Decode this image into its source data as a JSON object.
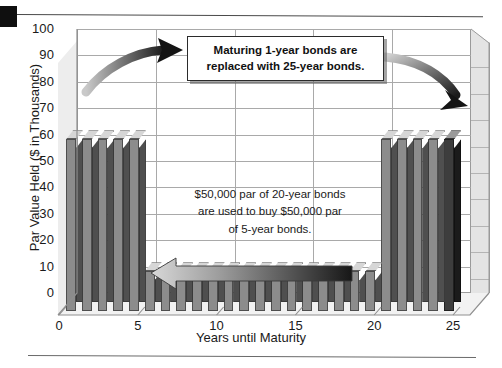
{
  "chart_data": {
    "type": "bar",
    "title": "",
    "xlabel": "Years until Maturity",
    "ylabel": "Par Value Held ($ in Thousands)",
    "ylim": [
      0,
      100
    ],
    "ytick_labels": [
      "100",
      "90",
      "80",
      "70",
      "60",
      "50",
      "40",
      "30",
      "20",
      "10",
      "0"
    ],
    "ytick_values": [
      100,
      90,
      80,
      70,
      60,
      50,
      40,
      30,
      20,
      10,
      0
    ],
    "xtick_labels": [
      "0",
      "5",
      "10",
      "15",
      "20",
      "25"
    ],
    "xtick_values": [
      0,
      5,
      10,
      15,
      20,
      25
    ],
    "grid": true,
    "legend": "none",
    "categories": [
      1,
      2,
      3,
      4,
      5,
      6,
      7,
      8,
      9,
      10,
      11,
      12,
      13,
      14,
      15,
      16,
      17,
      18,
      19,
      20,
      21,
      22,
      23,
      24,
      25
    ],
    "values": [
      65,
      65,
      65,
      65,
      65,
      15,
      15,
      15,
      15,
      15,
      15,
      15,
      15,
      15,
      15,
      15,
      15,
      15,
      15,
      15,
      65,
      65,
      65,
      65,
      65
    ],
    "bar_style": "3d-column",
    "highlight_last_bar": true,
    "colors": {
      "bar_front": "#8c8c8c",
      "bar_side": "#4f4f4f",
      "bar_top": "#d6d6d6",
      "bar_last_front": "#3d3d3d",
      "grid": "#a9a9a9",
      "plot_border": "#9a9a9a",
      "text": "#1a1a1a"
    },
    "annotations": [
      {
        "id": "callout-top",
        "text_line1": "Maturing 1-year bonds are",
        "text_line2": "replaced with 25-year bonds.",
        "style": "boxed-bold"
      },
      {
        "id": "note-middle",
        "text_line1": "$50,000 par of 20-year bonds",
        "text_line2": "are used to buy $50,000 par",
        "text_line3": "of 5-year bonds.",
        "style": "plain"
      },
      {
        "id": "arrow-left-curved",
        "shape": "curved-arrow",
        "direction": "up-right"
      },
      {
        "id": "arrow-right-curved",
        "shape": "curved-arrow",
        "direction": "down-right"
      },
      {
        "id": "arrow-block-left",
        "shape": "block-arrow",
        "direction": "left"
      }
    ]
  },
  "page": {
    "corner_mark": "",
    "rule_top": "",
    "rule_bottom": ""
  }
}
